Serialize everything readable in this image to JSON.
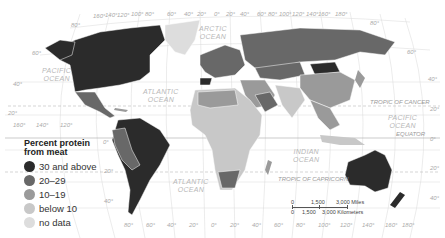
{
  "map": {
    "title": "Percent protein from meat",
    "legend": {
      "title_line1": "Percent protein",
      "title_line2": "from meat",
      "items": [
        {
          "label": "30 and above",
          "color": "#2b2b2b"
        },
        {
          "label": "20–29",
          "color": "#686868"
        },
        {
          "label": "10–19",
          "color": "#9a9a9a"
        },
        {
          "label": "below 10",
          "color": "#c8c8c8"
        },
        {
          "label": "no data",
          "color": "#dddddd"
        }
      ]
    },
    "oceans": {
      "arctic": "ARCTIC\nOCEAN",
      "pacific_west": "PACIFIC\nOCEAN",
      "atlantic_north": "ATLANTIC\nOCEAN",
      "atlantic_south": "ATLANTIC\nOCEAN",
      "indian": "INDIAN\nOCEAN",
      "pacific_east": "PACIFIC\nOCEAN"
    },
    "lines": {
      "tropic_cancer": "TROPIC OF CANCER",
      "tropic_capricorn": "TROPIC OF CAPRICORN",
      "equator": "EQUATOR"
    },
    "top_longitudes": [
      "160°",
      "140°",
      "120°",
      "100°",
      "80°",
      "60°",
      "40°",
      "20°",
      "0°",
      "20°",
      "40°",
      "60°",
      "80°",
      "100°",
      "120°",
      "140°",
      "160°",
      "180°"
    ],
    "bottom_longitudes": [
      "80°",
      "60°",
      "40°",
      "20°",
      "0°",
      "20°",
      "40°",
      "60°",
      "80°",
      "100°",
      "120°",
      "140°",
      "160°",
      "180°"
    ],
    "left_longitudes": [
      "160°",
      "140°",
      "120°"
    ],
    "latitudes_left": [
      "80°",
      "60°",
      "40°",
      "20°",
      "0°",
      "20°",
      "40°"
    ],
    "latitudes_right": [
      "80°",
      "60°",
      "40°",
      "20°",
      "0°",
      "20°",
      "40°"
    ],
    "scale": {
      "miles_labels": [
        "0",
        "1,500",
        "3,000 Miles"
      ],
      "km_labels": [
        "0",
        "1,500",
        "3,000 Kilometers"
      ]
    }
  }
}
